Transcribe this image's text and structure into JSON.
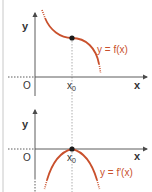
{
  "colors": {
    "curve": "#c9502c",
    "axis": "#4a4a4a",
    "dotted": "#9a9a9a",
    "border": "#c8c8c8",
    "point": "#1a1a1a",
    "label": "#c9502c",
    "text": "#333333"
  },
  "top_graph": {
    "y_axis_label": "y",
    "x_axis_label": "x",
    "origin_label": "O",
    "x0_label": "x",
    "x0_subscript": "0",
    "curve_label": "y = f(x)"
  },
  "bottom_graph": {
    "y_axis_label": "y",
    "x_axis_label": "x",
    "origin_label": "O",
    "x0_label": "x",
    "x0_subscript": "0",
    "curve_label": "y = f'(x)"
  }
}
